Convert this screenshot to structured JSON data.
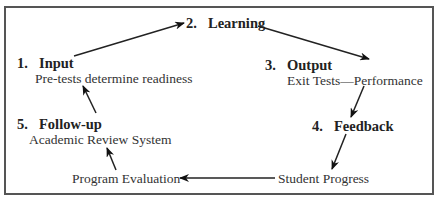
{
  "diagram": {
    "nodes": [
      {
        "number": "1.",
        "title": "Input",
        "subtitle": "Pre-tests determine readiness"
      },
      {
        "number": "2.",
        "title": "Learning"
      },
      {
        "number": "3.",
        "title": "Output",
        "subtitle": "Exit Tests—Performance"
      },
      {
        "number": "4.",
        "title": "Feedback"
      },
      {
        "label": "Student Progress"
      },
      {
        "label": "Program Evaluation"
      },
      {
        "number": "5.",
        "title": "Follow-up",
        "subtitle": "Academic Review System"
      }
    ],
    "edges": [
      {
        "from": "Input",
        "to": "Learning"
      },
      {
        "from": "Learning",
        "to": "Output"
      },
      {
        "from": "Output",
        "to": "Feedback"
      },
      {
        "from": "Feedback",
        "to": "Student Progress"
      },
      {
        "from": "Student Progress",
        "to": "Program Evaluation"
      },
      {
        "from": "Program Evaluation",
        "to": "Follow-up"
      },
      {
        "from": "Follow-up",
        "to": "Input"
      }
    ]
  }
}
